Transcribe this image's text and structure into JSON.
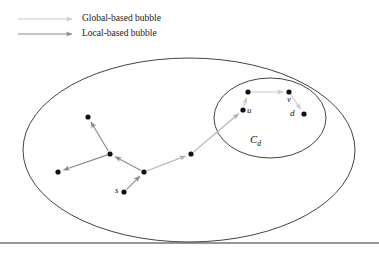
{
  "figure": {
    "name": "bubble-search-diagram",
    "background": "#ffffff",
    "width": 379,
    "height": 256
  },
  "legend": {
    "items": [
      {
        "id": "global-based-bubble",
        "label": "Global-based bubble",
        "color": "#c9c9c9",
        "arrow_x1": 18,
        "arrow_x2": 72,
        "arrow_y": 19
      },
      {
        "id": "local-based-bubble",
        "label": "Local-based bubble",
        "color": "#8a8a8a",
        "arrow_x1": 18,
        "arrow_x2": 72,
        "arrow_y": 34
      }
    ]
  },
  "shapes": {
    "outer_ellipse": {
      "name": "global-bubble-ellipse",
      "cx": 189,
      "cy": 150,
      "rx": 166,
      "ry": 92,
      "stroke": "#2e2e2e",
      "stroke_width": 0.9,
      "fill": "none"
    },
    "inner_ellipse": {
      "name": "local-bubble-ellipse",
      "cx": 270,
      "cy": 118,
      "rx": 56,
      "ry": 40,
      "stroke": "#2e2e2e",
      "stroke_width": 0.9,
      "fill": "none"
    },
    "bottom_rule": {
      "name": "bottom-divider",
      "x1": 0,
      "x2": 379,
      "y": 243,
      "stroke": "#2e2e2e",
      "stroke_width": 1.0
    }
  },
  "graph": {
    "node_color": "#111111",
    "node_radius": 2.6,
    "nodes": [
      {
        "id": "n-upper-left",
        "x": 88,
        "y": 117,
        "label": ""
      },
      {
        "id": "n-hub-left",
        "x": 110,
        "y": 154,
        "label": ""
      },
      {
        "id": "n-far-left",
        "x": 58,
        "y": 172,
        "label": ""
      },
      {
        "id": "n-hub",
        "x": 144,
        "y": 172,
        "label": ""
      },
      {
        "id": "n-s",
        "x": 124,
        "y": 192,
        "label": "s",
        "label_dx": -9,
        "label_dy": -1
      },
      {
        "id": "n-mid-right",
        "x": 191,
        "y": 154,
        "label": ""
      },
      {
        "id": "n-u",
        "x": 243,
        "y": 110,
        "label": "u",
        "label_dx": 4,
        "label_dy": 1
      },
      {
        "id": "n-top-inner",
        "x": 248,
        "y": 92,
        "label": ""
      },
      {
        "id": "n-v",
        "x": 289,
        "y": 92,
        "label": "v",
        "label_dx": -2,
        "label_dy": 8
      },
      {
        "id": "n-d",
        "x": 304,
        "y": 114,
        "label": "d",
        "label_dx": -14,
        "label_dy": 0
      }
    ],
    "edges": [
      {
        "id": "e-s-hub",
        "from": "n-s",
        "to": "n-hub",
        "color": "#8a8a8a"
      },
      {
        "id": "e-hub-hubleft",
        "from": "n-hub",
        "to": "n-hub-left",
        "color": "#8a8a8a"
      },
      {
        "id": "e-hubleft-upperleft",
        "from": "n-hub-left",
        "to": "n-upper-left",
        "color": "#8a8a8a"
      },
      {
        "id": "e-hubleft-farleft",
        "from": "n-hub-left",
        "to": "n-far-left",
        "color": "#8a8a8a"
      },
      {
        "id": "e-hub-midright",
        "from": "n-hub",
        "to": "n-mid-right",
        "color": "#b0b0b0"
      },
      {
        "id": "e-midright-u",
        "from": "n-mid-right",
        "to": "n-u",
        "color": "#b0b0b0"
      },
      {
        "id": "e-u-topinner",
        "from": "n-u",
        "to": "n-top-inner",
        "color": "#cacaca"
      },
      {
        "id": "e-topinner-v",
        "from": "n-top-inner",
        "to": "n-v",
        "color": "#cacaca"
      },
      {
        "id": "e-v-d",
        "from": "n-v",
        "to": "n-d",
        "color": "#cacaca"
      }
    ]
  },
  "regions": {
    "local_cluster_label": {
      "id": "cluster-label-cd",
      "base": "C",
      "subscript": "d",
      "x": 250,
      "y": 134
    }
  }
}
